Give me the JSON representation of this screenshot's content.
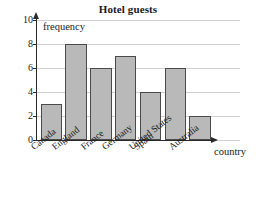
{
  "chart_data": {
    "type": "bar",
    "title": "Hotel guests",
    "xlabel": "country",
    "ylabel": "frequency",
    "categories": [
      "Canada",
      "England",
      "France",
      "Germany",
      "Spain",
      "United States",
      "Australia"
    ],
    "values": [
      3,
      8,
      6,
      7,
      4,
      6,
      2
    ],
    "ylim": [
      0,
      10
    ],
    "yticks": [
      0,
      2,
      4,
      6,
      8,
      10
    ],
    "ytick_labels": [
      "0",
      "2",
      "4",
      "6",
      "8",
      "10"
    ],
    "grid": true,
    "grid_axis": "y",
    "legend": false,
    "bar_fill": "#b9b9b9",
    "bar_border": "#4a4a4a",
    "axis_color": "#2a2a2a",
    "grid_color": "#d2d2d2",
    "background": "#ffffff"
  }
}
